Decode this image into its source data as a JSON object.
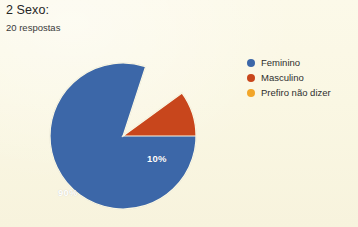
{
  "question": {
    "title": "2 Sexo:",
    "response_count": "20 respostas"
  },
  "chart_data": {
    "type": "pie",
    "title": "2 Sexo:",
    "subtitle": "20 respostas",
    "categories": [
      "Feminino",
      "Masculino",
      "Prefiro não dizer"
    ],
    "values": [
      90,
      10,
      0
    ],
    "value_labels": [
      "90%",
      "10%",
      ""
    ],
    "colors": [
      "#3c67a8",
      "#c8461c",
      "#f2a629"
    ],
    "legend_position": "right",
    "grid": false,
    "total_responses": 20,
    "slices": [
      {
        "label": "Feminino",
        "percent": "90%",
        "value": 90,
        "color": "#3c67a8"
      },
      {
        "label": "Masculino",
        "percent": "10%",
        "value": 10,
        "color": "#c8461c"
      },
      {
        "label": "Prefiro não dizer",
        "percent": "0%",
        "value": 0,
        "color": "#f2a629"
      }
    ]
  },
  "legend": {
    "items": [
      {
        "label": "Feminino",
        "color": "#3c67a8"
      },
      {
        "label": "Masculino",
        "color": "#c8461c"
      },
      {
        "label": "Prefiro não dizer",
        "color": "#f2a629"
      }
    ]
  },
  "labels": {
    "major": "90%",
    "minor": "10%"
  },
  "theme": {
    "background": "#faf7e3",
    "text": "#2b2b2b"
  }
}
